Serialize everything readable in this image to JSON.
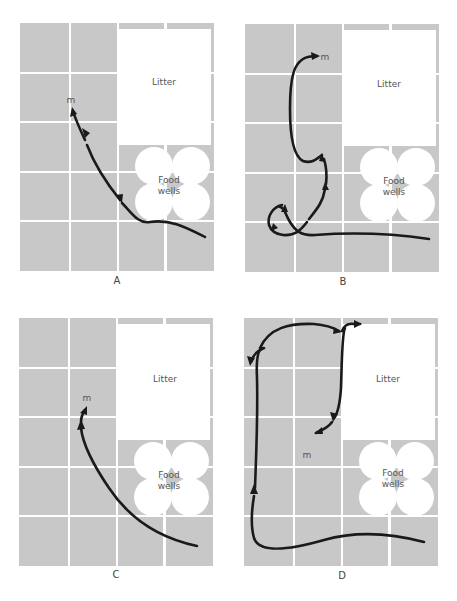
{
  "figure": {
    "colors": {
      "cell": "#c8c8c8",
      "background": "#ffffff",
      "path": "#1a1a1a",
      "text": "#555555"
    },
    "grid": {
      "columns": 4,
      "rows": 5
    },
    "labels": {
      "litter": "Litter",
      "food_line1": "Food",
      "food_line2": "wells",
      "marker": "m"
    },
    "panels": [
      {
        "id": "A",
        "label": "A"
      },
      {
        "id": "B",
        "label": "B"
      },
      {
        "id": "C",
        "label": "C"
      },
      {
        "id": "D",
        "label": "D"
      }
    ]
  }
}
